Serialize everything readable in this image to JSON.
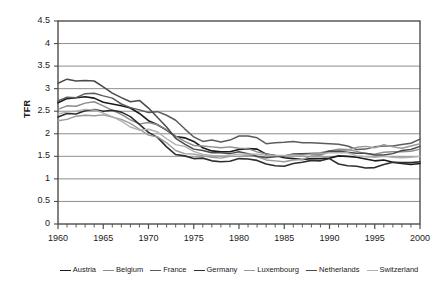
{
  "chart_data": {
    "type": "line",
    "title": "",
    "xlabel": "",
    "ylabel": "TFR",
    "xlim": [
      1960,
      2000
    ],
    "ylim": [
      0,
      4.5
    ],
    "ytick_step": 0.5,
    "xtick_step": 5,
    "minor_xtick_step": 1,
    "grid": "horizontal",
    "legend_position": "bottom",
    "ytick_labels": [
      "4.5",
      "4",
      "3.5",
      "3",
      "2.5",
      "2",
      "1.5",
      "1",
      "0.5",
      "0"
    ],
    "ytick_values": [
      4.5,
      4,
      3.5,
      3,
      2.5,
      2,
      1.5,
      1,
      0.5,
      0
    ],
    "xtick_labels": [
      "1960",
      "1965",
      "1970",
      "1975",
      "1980",
      "1985",
      "1990",
      "1995",
      "2000"
    ],
    "xtick_values": [
      1960,
      1965,
      1970,
      1975,
      1980,
      1985,
      1990,
      1995,
      2000
    ],
    "x": [
      1960,
      1961,
      1962,
      1963,
      1964,
      1965,
      1966,
      1967,
      1968,
      1969,
      1970,
      1971,
      1972,
      1973,
      1974,
      1975,
      1976,
      1977,
      1978,
      1979,
      1980,
      1981,
      1982,
      1983,
      1984,
      1985,
      1986,
      1987,
      1988,
      1989,
      1990,
      1991,
      1992,
      1993,
      1994,
      1995,
      1996,
      1997,
      1998,
      1999,
      2000
    ],
    "series": [
      {
        "name": "Austria",
        "color": "#1a1a1a",
        "width": 1.6,
        "values": [
          2.69,
          2.78,
          2.8,
          2.82,
          2.79,
          2.7,
          2.66,
          2.62,
          2.57,
          2.45,
          2.29,
          2.2,
          2.08,
          1.94,
          1.91,
          1.83,
          1.69,
          1.62,
          1.6,
          1.6,
          1.65,
          1.67,
          1.66,
          1.55,
          1.52,
          1.47,
          1.45,
          1.43,
          1.45,
          1.45,
          1.46,
          1.51,
          1.5,
          1.48,
          1.44,
          1.4,
          1.42,
          1.37,
          1.34,
          1.32,
          1.34
        ]
      },
      {
        "name": "Belgium",
        "color": "#8c8c8c",
        "width": 1.4,
        "values": [
          2.54,
          2.62,
          2.61,
          2.68,
          2.71,
          2.62,
          2.52,
          2.43,
          2.31,
          2.22,
          2.25,
          2.2,
          2.09,
          1.95,
          1.83,
          1.74,
          1.73,
          1.71,
          1.69,
          1.71,
          1.68,
          1.67,
          1.6,
          1.55,
          1.52,
          1.51,
          1.54,
          1.56,
          1.57,
          1.58,
          1.62,
          1.66,
          1.65,
          1.61,
          1.56,
          1.55,
          1.59,
          1.6,
          1.6,
          1.61,
          1.66
        ]
      },
      {
        "name": "France",
        "color": "#5c5c5c",
        "width": 1.5,
        "values": [
          2.73,
          2.81,
          2.8,
          2.89,
          2.9,
          2.84,
          2.79,
          2.66,
          2.58,
          2.53,
          2.47,
          2.49,
          2.41,
          2.3,
          2.11,
          1.93,
          1.83,
          1.86,
          1.82,
          1.86,
          1.95,
          1.95,
          1.91,
          1.78,
          1.8,
          1.81,
          1.83,
          1.8,
          1.8,
          1.79,
          1.78,
          1.77,
          1.73,
          1.65,
          1.66,
          1.71,
          1.73,
          1.73,
          1.76,
          1.79,
          1.88
        ]
      },
      {
        "name": "Germany",
        "color": "#2e2e2e",
        "width": 1.6,
        "values": [
          2.37,
          2.45,
          2.44,
          2.51,
          2.54,
          2.5,
          2.52,
          2.48,
          2.38,
          2.21,
          2.03,
          1.92,
          1.71,
          1.54,
          1.51,
          1.45,
          1.46,
          1.4,
          1.38,
          1.39,
          1.45,
          1.44,
          1.41,
          1.33,
          1.29,
          1.28,
          1.34,
          1.37,
          1.41,
          1.4,
          1.45,
          1.33,
          1.29,
          1.28,
          1.24,
          1.25,
          1.32,
          1.37,
          1.36,
          1.36,
          1.38
        ]
      },
      {
        "name": "Luxembourg",
        "color": "#9a9a9a",
        "width": 1.4,
        "values": [
          2.29,
          2.32,
          2.39,
          2.41,
          2.4,
          2.42,
          2.37,
          2.32,
          2.23,
          2.1,
          1.97,
          1.93,
          1.8,
          1.63,
          1.56,
          1.55,
          1.51,
          1.48,
          1.46,
          1.5,
          1.5,
          1.52,
          1.49,
          1.42,
          1.4,
          1.38,
          1.42,
          1.43,
          1.51,
          1.52,
          1.6,
          1.62,
          1.64,
          1.7,
          1.72,
          1.69,
          1.76,
          1.71,
          1.68,
          1.73,
          1.78
        ]
      },
      {
        "name": "Netherlands",
        "color": "#4a4a4a",
        "width": 1.5,
        "values": [
          3.12,
          3.21,
          3.17,
          3.18,
          3.17,
          3.04,
          2.9,
          2.8,
          2.71,
          2.74,
          2.57,
          2.36,
          2.15,
          1.9,
          1.77,
          1.66,
          1.63,
          1.58,
          1.58,
          1.56,
          1.6,
          1.56,
          1.5,
          1.47,
          1.49,
          1.51,
          1.55,
          1.56,
          1.55,
          1.55,
          1.62,
          1.61,
          1.59,
          1.57,
          1.57,
          1.53,
          1.53,
          1.56,
          1.63,
          1.65,
          1.72
        ]
      },
      {
        "name": "Switzerland",
        "color": "#b0b0b0",
        "width": 1.4,
        "values": [
          2.44,
          2.48,
          2.5,
          2.54,
          2.53,
          2.46,
          2.38,
          2.28,
          2.15,
          2.08,
          2.1,
          2.04,
          1.89,
          1.76,
          1.72,
          1.61,
          1.54,
          1.52,
          1.51,
          1.52,
          1.55,
          1.55,
          1.55,
          1.52,
          1.52,
          1.52,
          1.53,
          1.52,
          1.55,
          1.56,
          1.58,
          1.58,
          1.58,
          1.51,
          1.49,
          1.48,
          1.5,
          1.48,
          1.47,
          1.48,
          1.5
        ]
      }
    ]
  },
  "legend": {
    "items": [
      {
        "label": "Austria"
      },
      {
        "label": "Belgium"
      },
      {
        "label": "France"
      },
      {
        "label": "Germany"
      },
      {
        "label": "Luxembourg"
      },
      {
        "label": "Netherlands"
      },
      {
        "label": "Switzerland"
      }
    ]
  },
  "colors": {
    "plot_border": "#4d4d4d",
    "gridline": "#808080",
    "text": "#1a1a1a",
    "background": "#ffffff"
  }
}
